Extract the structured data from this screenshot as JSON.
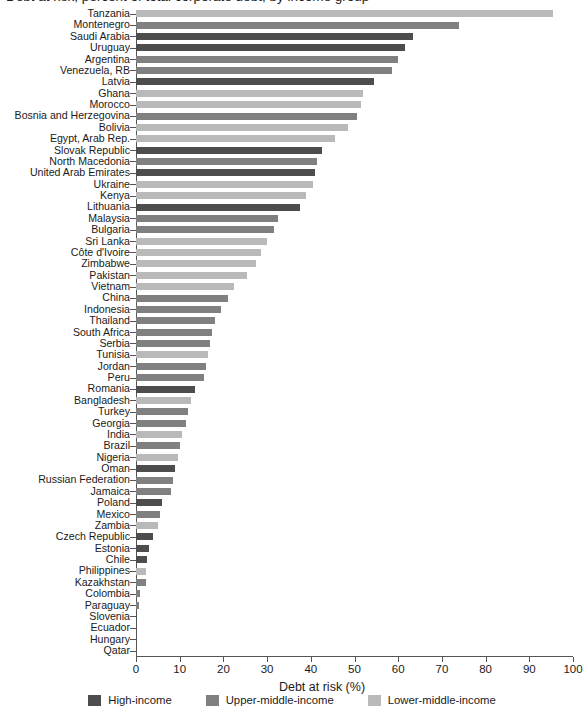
{
  "title": "Debt at risk, percent of total corporate debt, by income group",
  "axis": {
    "x_label": "Debt at risk (%)",
    "x_ticks": [
      0,
      10,
      20,
      30,
      40,
      50,
      60,
      70,
      80,
      90,
      100
    ],
    "x_min": 0,
    "x_max": 100
  },
  "legend": {
    "position": "bottom",
    "items": [
      {
        "label": "High-income",
        "color": "#4d4d4d",
        "key": "high"
      },
      {
        "label": "Upper-middle-income",
        "color": "#808080",
        "key": "upper"
      },
      {
        "label": "Lower-middle-income",
        "color": "#b9b9b9",
        "key": "lower"
      }
    ]
  },
  "colors": {
    "high": "#4d4d4d",
    "upper": "#808080",
    "lower": "#b9b9b9",
    "axis": "#555555",
    "text": "#1a1a1a",
    "background": "#ffffff"
  },
  "chart_data": {
    "type": "bar",
    "orientation": "horizontal",
    "title": "Debt at risk, percent of total corporate debt, by income group",
    "xlabel": "Debt at risk (%)",
    "ylabel": "",
    "xlim": [
      0,
      100
    ],
    "grid": false,
    "legend_position": "bottom",
    "group_key": "income_group",
    "categories": [
      "Tanzania",
      "Montenegro",
      "Saudi Arabia",
      "Uruguay",
      "Argentina",
      "Venezuela, RB",
      "Latvia",
      "Ghana",
      "Morocco",
      "Bosnia and Herzegovina",
      "Bolivia",
      "Egypt, Arab Rep.",
      "Slovak Republic",
      "North Macedonia",
      "United Arab Emirates",
      "Ukraine",
      "Kenya",
      "Lithuania",
      "Malaysia",
      "Bulgaria",
      "Sri Lanka",
      "Côte d'Ivoire",
      "Zimbabwe",
      "Pakistan",
      "Vietnam",
      "China",
      "Indonesia",
      "Thailand",
      "South Africa",
      "Serbia",
      "Tunisia",
      "Jordan",
      "Peru",
      "Romania",
      "Bangladesh",
      "Turkey",
      "Georgia",
      "India",
      "Brazil",
      "Nigeria",
      "Oman",
      "Russian Federation",
      "Jamaica",
      "Poland",
      "Mexico",
      "Zambia",
      "Czech Republic",
      "Estonia",
      "Chile",
      "Philippines",
      "Kazakhstan",
      "Colombia",
      "Paraguay",
      "Slovenia",
      "Ecuador",
      "Hungary",
      "Qatar"
    ],
    "values": [
      95.5,
      74.0,
      63.5,
      61.5,
      60.0,
      58.5,
      54.5,
      52.0,
      51.5,
      50.5,
      48.5,
      45.5,
      42.5,
      41.5,
      41.0,
      40.5,
      39.0,
      37.5,
      32.5,
      31.5,
      30.0,
      28.5,
      27.5,
      25.5,
      22.5,
      21.0,
      19.5,
      18.0,
      17.5,
      17.0,
      16.5,
      16.0,
      15.5,
      13.5,
      12.5,
      12.0,
      11.5,
      10.5,
      10.0,
      9.5,
      9.0,
      8.5,
      8.0,
      6.0,
      5.5,
      5.0,
      4.0,
      3.0,
      2.5,
      2.2,
      2.2,
      1.0,
      0.8,
      0.3,
      0.0,
      0.0,
      0.0
    ],
    "income_group": [
      "lower",
      "upper",
      "high",
      "high",
      "upper",
      "upper",
      "high",
      "lower",
      "lower",
      "upper",
      "lower",
      "lower",
      "high",
      "upper",
      "high",
      "lower",
      "lower",
      "high",
      "upper",
      "upper",
      "lower",
      "lower",
      "lower",
      "lower",
      "lower",
      "upper",
      "upper",
      "upper",
      "upper",
      "upper",
      "lower",
      "upper",
      "upper",
      "high",
      "lower",
      "upper",
      "upper",
      "lower",
      "upper",
      "lower",
      "high",
      "upper",
      "upper",
      "high",
      "upper",
      "lower",
      "high",
      "high",
      "high",
      "lower",
      "upper",
      "upper",
      "upper",
      "high",
      "upper",
      "high",
      "high"
    ]
  }
}
